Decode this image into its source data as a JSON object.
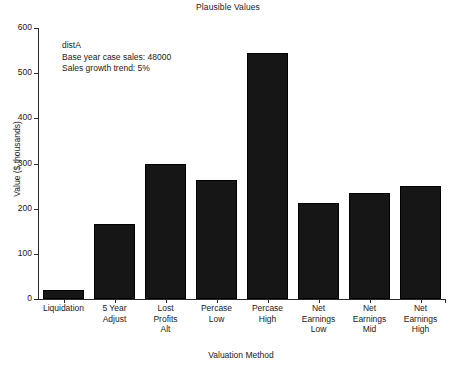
{
  "chart_data": {
    "type": "bar",
    "title": "Plausible Values",
    "xlabel": "Valuation Method",
    "ylabel": "Value ($ thousands)",
    "categories": [
      "Liquidation",
      "5 Year Adjust",
      "Lost Profits Alt",
      "Percase Low",
      "Percase High",
      "Net Earnings Low",
      "Net Earnings Mid",
      "Net Earnings High"
    ],
    "category_lines": [
      [
        "Liquidation"
      ],
      [
        "5 Year",
        "Adjust"
      ],
      [
        "Lost",
        "Profits",
        "Alt"
      ],
      [
        "Percase",
        "Low"
      ],
      [
        "Percase",
        "High"
      ],
      [
        "Net",
        "Earnings",
        "Low"
      ],
      [
        "Net",
        "Earnings",
        "Mid"
      ],
      [
        "Net",
        "Earnings",
        "High"
      ]
    ],
    "values": [
      20,
      165,
      300,
      263,
      545,
      212,
      234,
      250
    ],
    "ylim": [
      0,
      600
    ],
    "yticks": [
      0,
      100,
      200,
      300,
      400,
      500,
      600
    ],
    "ytick_labels": [
      "0",
      "100",
      "200",
      "300",
      "400",
      "500",
      "600"
    ],
    "grid": false,
    "legend": "none",
    "bar_color": "#161616",
    "background_color": "#ffffff",
    "axis_color": "#2b2b2b"
  },
  "annotation": {
    "line1": "distA",
    "line2": "Base year case sales: 48000",
    "line3": "Sales growth trend: 5%"
  }
}
